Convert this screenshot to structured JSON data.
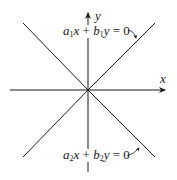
{
  "diagram": {
    "axes": {
      "x_label": "x",
      "y_label": "y"
    },
    "lines": [
      {
        "id": "line1",
        "label_parts": {
          "a": "a",
          "a_sub": "1",
          "x": "x",
          "plus": " + ",
          "b": "b",
          "b_sub": "1",
          "y": "y",
          "eq": " = 0"
        },
        "equation": "a1x + b1y = 0"
      },
      {
        "id": "line2",
        "label_parts": {
          "a": "a",
          "a_sub": "2",
          "x": "x",
          "plus": " + ",
          "b": "b",
          "b_sub": "2",
          "y": "y",
          "eq": " = 0"
        },
        "equation": "a2x + b2y = 0"
      }
    ],
    "colors": {
      "stroke": "#1a1a1a",
      "background": "#ffffff"
    }
  }
}
